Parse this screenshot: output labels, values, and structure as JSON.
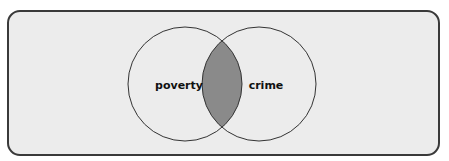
{
  "diagram": {
    "type": "venn",
    "sets": [
      {
        "id": "left",
        "label": "poverty",
        "cx": 185,
        "cy": 84,
        "r": 57
      },
      {
        "id": "right",
        "label": "crime",
        "cx": 259,
        "cy": 84,
        "r": 57
      }
    ],
    "intersection": {
      "label": "",
      "fill": "#8a8a8a"
    },
    "colors": {
      "frame_background": "#ececec",
      "frame_border": "#3a3a3a",
      "circle_stroke": "#333333",
      "intersection_fill": "#8a8a8a"
    }
  }
}
